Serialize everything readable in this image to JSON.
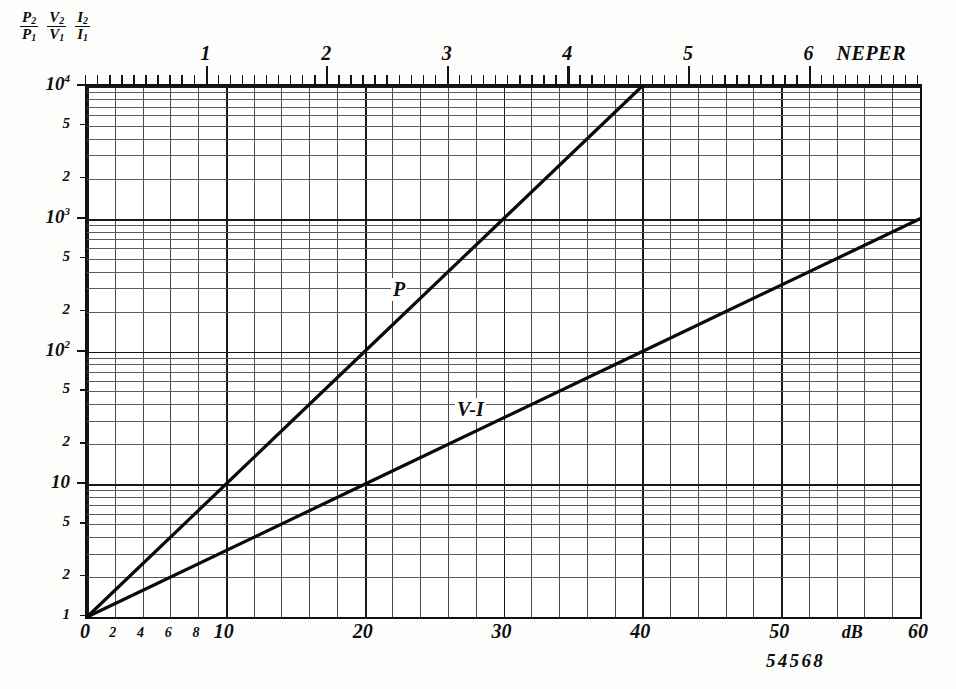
{
  "figure": {
    "number": "54568",
    "y_axis_header": [
      {
        "num": "P",
        "num_sub": "2",
        "den": "P",
        "den_sub": "1"
      },
      {
        "num": "V",
        "num_sub": "2",
        "den": "V",
        "den_sub": "1"
      },
      {
        "num": "I",
        "num_sub": "2",
        "den": "I",
        "den_sub": "1"
      }
    ],
    "top_unit": "NEPER",
    "bottom_unit": "dB"
  },
  "chart_data": {
    "type": "line",
    "title": "",
    "subtitle": "",
    "xlabel": "dB",
    "ylabel": "P2/P1  V2/V1  I2/I1",
    "top_axis_label": "NEPER",
    "grid": true,
    "legend_position": "inline-annotations",
    "xscale": "linear",
    "yscale": "log",
    "xlim": [
      0,
      60
    ],
    "ylim": [
      1,
      10000
    ],
    "x_ticks_major": [
      0,
      10,
      20,
      30,
      40,
      50,
      60
    ],
    "x_ticks_major_labels": [
      "0",
      "10",
      "20",
      "30",
      "40",
      "50",
      "60"
    ],
    "x_ticks_minor": [
      2,
      4,
      6,
      8
    ],
    "x_ticks_minor_labels": [
      "2",
      "4",
      "6",
      "8"
    ],
    "x_grid_step": 2,
    "top_axis_lim": [
      0,
      6.9077
    ],
    "top_axis_ticks": [
      1,
      2,
      3,
      4,
      5,
      6
    ],
    "top_axis_tick_labels": [
      "1",
      "2",
      "3",
      "4",
      "5",
      "6"
    ],
    "top_axis_minor_step": 0.1,
    "neper_per_db": 0.11513,
    "y_ticks": [
      1,
      2,
      5,
      10,
      20,
      50,
      100,
      200,
      500,
      1000,
      2000,
      5000,
      10000
    ],
    "y_tick_labels": [
      "1",
      "2",
      "5",
      "10",
      "2",
      "5",
      "10²",
      "2",
      "5",
      "10³",
      "2",
      "5",
      "10⁴"
    ],
    "series": [
      {
        "name": "P",
        "annotation": "P",
        "formula": "ratio = 10^(dB/10)",
        "x": [
          0,
          10,
          20,
          30,
          40
        ],
        "values": [
          1,
          10,
          100,
          1000,
          10000
        ],
        "x_end": 40,
        "y_end": 10000
      },
      {
        "name": "V-I",
        "annotation": "V-I",
        "formula": "ratio = 10^(dB/20)",
        "x": [
          0,
          20,
          40,
          60
        ],
        "values": [
          1,
          10,
          100,
          1000
        ],
        "x_end": 60,
        "y_end": 1000
      }
    ]
  }
}
